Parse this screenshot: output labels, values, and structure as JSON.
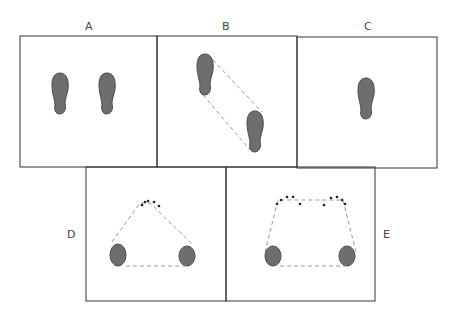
{
  "panels": [
    {
      "id": "A",
      "label": "A",
      "description": "two footprints side by side"
    },
    {
      "id": "B",
      "label": "B",
      "description": "two footprints diagonally offset joined by dashed lines"
    },
    {
      "id": "C",
      "label": "C",
      "description": "single footprint"
    },
    {
      "id": "D",
      "label": "D",
      "description": "tripod stance: two heel pads and one cluster of toe dots forming dashed triangle"
    },
    {
      "id": "E",
      "label": "E",
      "description": "two heel pads and two toe-dot clusters forming dashed trapezoid"
    }
  ],
  "colors": {
    "border": "#333333",
    "fill": "#6e6e6e",
    "dash": "#999999"
  }
}
